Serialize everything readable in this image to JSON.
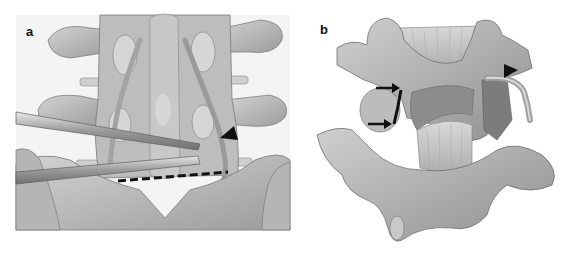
{
  "figure": {
    "panels": [
      {
        "id": "a",
        "label": "a",
        "description": "Posterior view of lumbar spine and sacrum with two surgical instruments retracting a nerve root; dashed line marks a level; arrowhead points to the nerve root",
        "annotations": {
          "arrowhead": "black triangle pointing at nerve root",
          "dashed_line": "black horizontal dashed line"
        }
      },
      {
        "id": "b",
        "label": "b",
        "description": "Oblique view of lumbar vertebrae with a curved nerve root exiting laterally; two arrows point to a bony edge; arrowhead points to the nerve root",
        "annotations": {
          "arrows": "two black arrows pointing right",
          "arrowhead": "black triangle pointing at nerve root"
        }
      }
    ],
    "colors": {
      "bone_light": "#c9c9c9",
      "bone_mid": "#a9a9a9",
      "bone_dark": "#7f7f7f",
      "outline": "#6a6a6a",
      "annotation": "#111111",
      "background": "#ffffff"
    }
  }
}
